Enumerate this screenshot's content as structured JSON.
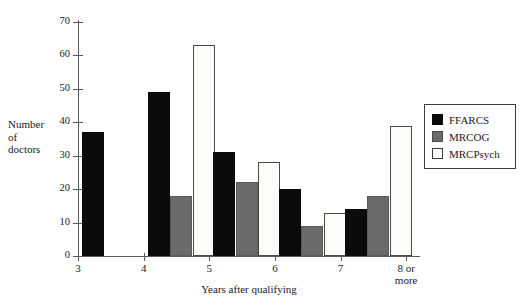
{
  "chart_data": {
    "type": "bar",
    "title": "",
    "xlabel": "Years after qualifying",
    "ylabel": "Number of doctors",
    "ylabel_lines": [
      "Number",
      "of",
      "doctors"
    ],
    "categories": [
      "3",
      "4",
      "5",
      "6",
      "7",
      "8 or more"
    ],
    "category_labels_wrapped": [
      [
        "3"
      ],
      [
        "4"
      ],
      [
        "5"
      ],
      [
        "6"
      ],
      [
        "7"
      ],
      [
        "8 or",
        "more"
      ]
    ],
    "series": [
      {
        "name": "FFARCS",
        "color": "#0b0b0b",
        "values": [
          37,
          49,
          31,
          20,
          14,
          null
        ]
      },
      {
        "name": "MRCOG",
        "color": "#6b6b6b",
        "values": [
          null,
          18,
          22,
          9,
          18,
          null
        ]
      },
      {
        "name": "MRCPsych",
        "color": "#ffffff",
        "values": [
          null,
          63,
          28,
          13,
          39,
          null
        ]
      }
    ],
    "ylim": [
      0,
      70
    ],
    "yticks": [
      0,
      10,
      20,
      30,
      40,
      50,
      60,
      70
    ],
    "ytick_labels": [
      "0",
      "10",
      "20",
      "30",
      "40",
      "50",
      "60",
      "70"
    ],
    "grid": false,
    "legend_position": "right",
    "legend_entries": [
      "FFARCS",
      "MRCOG",
      "MRCPsych"
    ]
  },
  "axis": {
    "y_label_line1": "Number",
    "y_label_line2": "of",
    "y_label_line3": "doctors",
    "x_title": "Years after qualifying"
  },
  "legend": {
    "items": [
      {
        "label": "FFARCS",
        "swatch": "black"
      },
      {
        "label": "MRCOG",
        "swatch": "gray"
      },
      {
        "label": "MRCPsych",
        "swatch": "white"
      }
    ]
  }
}
